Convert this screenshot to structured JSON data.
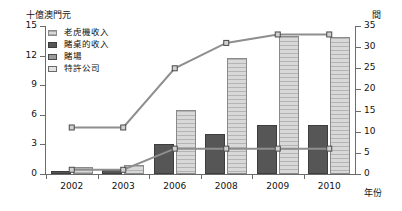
{
  "chart_data": {
    "type": "bar",
    "title": "",
    "categories": [
      "2002",
      "2003",
      "2006",
      "2008",
      "2009",
      "2010"
    ],
    "xlabel": "年份",
    "ylabel": "十億澳門元",
    "ylabel_right": "間",
    "ylim": [
      0,
      15
    ],
    "ylim_right": [
      0,
      35
    ],
    "yticks": [
      0,
      3,
      6,
      9,
      12,
      15
    ],
    "yticks_right": [
      0,
      5,
      10,
      15,
      20,
      25,
      30,
      35
    ],
    "grid": false,
    "legend_position": "upper-left",
    "series": [
      {
        "name": "老虎機收入",
        "kind": "bar",
        "axis": "left",
        "color": "#d8d8d8",
        "values": [
          0.7,
          0.9,
          6.5,
          11.8,
          14.0,
          13.9
        ]
      },
      {
        "name": "賭桌的收入",
        "kind": "bar",
        "axis": "left",
        "color": "#565656",
        "values": [
          0.35,
          0.4,
          3.0,
          4.1,
          5.0,
          5.0
        ]
      },
      {
        "name": "賭場",
        "kind": "line",
        "axis": "right",
        "color": "#8e8e8e",
        "values": [
          11,
          11,
          25,
          31,
          33,
          33
        ]
      },
      {
        "name": "特許公司",
        "kind": "line",
        "axis": "right",
        "color": "#8e8e8e",
        "values": [
          1,
          1,
          6,
          6,
          6,
          6
        ]
      }
    ]
  },
  "legend": {
    "items": [
      {
        "label": "老虎機收入"
      },
      {
        "label": "賭桌的收入"
      },
      {
        "label": "賭場"
      },
      {
        "label": "特許公司"
      }
    ]
  },
  "axes": {
    "unit_left": "十億澳門元",
    "unit_right": "間",
    "unit_x": "年份"
  }
}
